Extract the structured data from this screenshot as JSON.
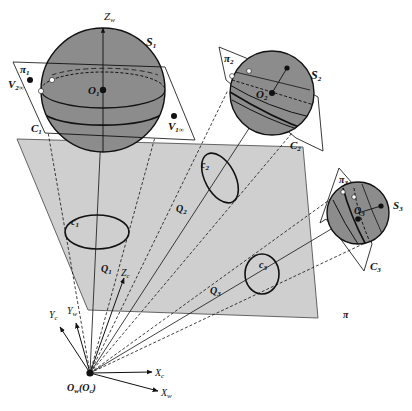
{
  "diagram": {
    "type": "camera-projection-geometry",
    "colors": {
      "background": "#ffffff",
      "plane_fill": "#cfcfcf",
      "sphere_fill": "#8c8c8c",
      "line": "#111111"
    },
    "origin": {
      "label": "O",
      "label_sub": "w",
      "label_paren": "(O",
      "label_paren_sub": "c",
      "label_close": ")"
    },
    "axes": {
      "zw": {
        "main": "Z",
        "sub": "w"
      },
      "zc": {
        "main": "Z",
        "sub": "c"
      },
      "yc": {
        "main": "Y",
        "sub": "c"
      },
      "yw": {
        "main": "Y",
        "sub": "w"
      },
      "xc": {
        "main": "X",
        "sub": "c"
      },
      "xw": {
        "main": "X",
        "sub": "w"
      }
    },
    "image_plane": {
      "label": "π"
    },
    "spheres": [
      {
        "name": "S",
        "sub": "1",
        "center": "O",
        "center_sub": "1",
        "plane": "π",
        "plane_sub": "1",
        "contour": "C",
        "contour_sub": "1",
        "projection": "c",
        "projection_sub": "1",
        "cone": "Q",
        "cone_sub": "1"
      },
      {
        "name": "S",
        "sub": "2",
        "center": "O",
        "center_sub": "2",
        "plane": "π",
        "plane_sub": "2",
        "contour": "C",
        "contour_sub": "2",
        "projection": "c",
        "projection_sub": "2",
        "cone": "Q",
        "cone_sub": "2"
      },
      {
        "name": "S",
        "sub": "3",
        "center": "O",
        "center_sub": "3",
        "plane": "π",
        "plane_sub": "3",
        "contour": "C",
        "contour_sub": "3",
        "projection": "c",
        "projection_sub": "3",
        "cone": "Q",
        "cone_sub": "3"
      }
    ],
    "vanishing_points": [
      {
        "main": "V",
        "sub": "2∞"
      },
      {
        "main": "V",
        "sub": "1∞"
      }
    ]
  }
}
